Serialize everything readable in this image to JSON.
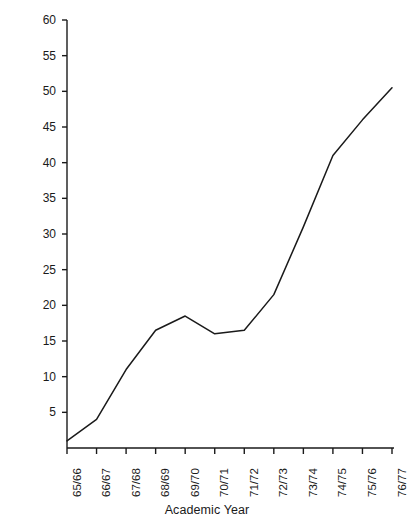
{
  "chart_data": {
    "type": "line",
    "title": "",
    "xlabel": "Academic Year",
    "ylabel": "Number of Pupils (in thousands)",
    "categories": [
      "65/66",
      "66/67",
      "67/68",
      "68/69",
      "69/70",
      "70/71",
      "71/72",
      "72/73",
      "73/74",
      "74/75",
      "75/76",
      "76/77"
    ],
    "values": [
      1,
      4,
      11,
      16.5,
      18.5,
      16,
      16.5,
      21.5,
      31,
      41,
      46,
      50.5
    ],
    "series": [
      {
        "name": "Number of Pupils",
        "values": [
          1,
          4,
          11,
          16.5,
          18.5,
          16,
          16.5,
          21.5,
          31,
          41,
          46,
          50.5
        ]
      }
    ],
    "ylim": [
      0,
      60
    ],
    "ytick_values": [
      5,
      10,
      15,
      20,
      25,
      30,
      35,
      40,
      45,
      50,
      55,
      60
    ],
    "ytick_labels": [
      "5",
      "10",
      "15",
      "20",
      "25",
      "30",
      "35",
      "40",
      "45",
      "50",
      "55",
      "60"
    ],
    "grid": false,
    "legend": false,
    "line_color": "#1a1a1a",
    "axis_color": "#1a1a1a",
    "background_color": "#ffffff"
  }
}
